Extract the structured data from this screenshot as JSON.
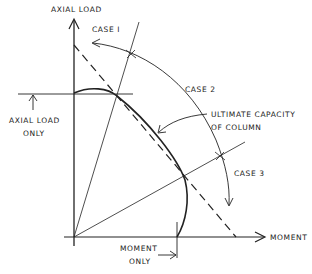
{
  "diagram": {
    "axes": {
      "y_label": "AXIAL LOAD",
      "x_label": "MOMENT"
    },
    "labels": {
      "case1": "CASE I",
      "case2": "CASE 2",
      "case3": "CASE 3",
      "ultimate_line1": "ULTIMATE CAPACITY",
      "ultimate_line2": "OF COLUMN",
      "axial_only_line1": "AXIAL LOAD",
      "axial_only_line2": "ONLY",
      "moment_only_line1": "MOMENT",
      "moment_only_line2": "ONLY"
    },
    "colors": {
      "ink": "#222222",
      "background": "#ffffff"
    }
  }
}
